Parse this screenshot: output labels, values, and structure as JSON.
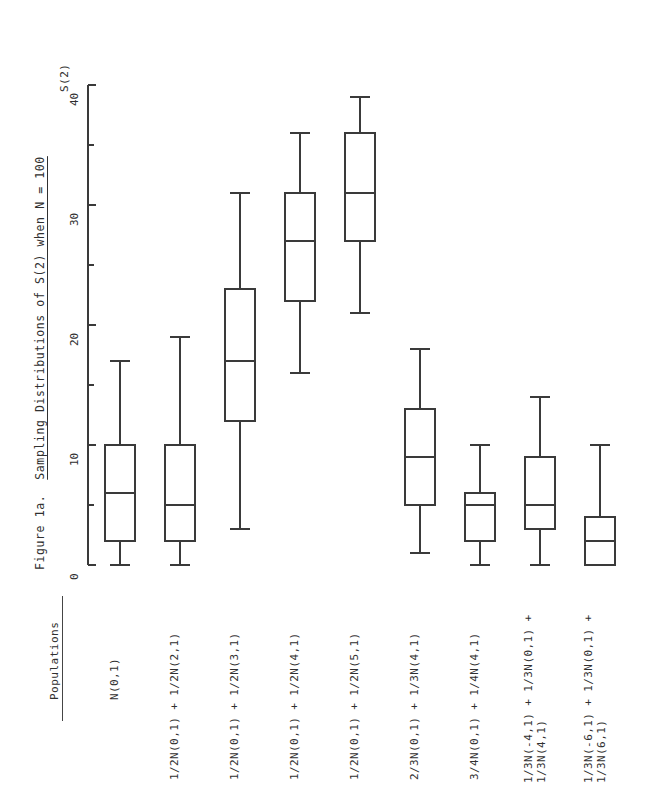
{
  "figure": {
    "caption_prefix": "Figure 1a.",
    "caption_title": "Sampling Distributions of S(2) when N = 100",
    "axis_title": "S(2)",
    "populations_header": "Populations"
  },
  "chart_data": {
    "type": "box",
    "xlabel": "Populations",
    "ylabel": "S(2)",
    "ylim": [
      0,
      42
    ],
    "yticks": [
      0,
      5,
      10,
      15,
      20,
      25,
      30,
      35,
      40
    ],
    "ytick_labels": [
      "0",
      "",
      "10",
      "",
      "20",
      "",
      "30",
      "",
      "40"
    ],
    "grid": false,
    "legend": "none",
    "orientation": "vertical",
    "categories": [
      "N(0,1)",
      "1/2N(0,1) + 1/2N(2,1)",
      "1/2N(0,1) + 1/2N(3,1)",
      "1/2N(0,1) + 1/2N(4,1)",
      "1/2N(0,1) + 1/2N(5,1)",
      "2/3N(0,1) + 1/3N(4,1)",
      "3/4N(0,1) + 1/4N(4,1)",
      "1/3N(-4,1) + 1/3N(0,1) +\n1/3N(4,1)",
      "1/3N(-6,1) + 1/3N(0,1) +\n1/3N(6,1)"
    ],
    "boxes": [
      {
        "label": "N(0,1)",
        "min": 0,
        "q1": 2,
        "median": 6,
        "q3": 10,
        "max": 17
      },
      {
        "label": "1/2N(0,1) + 1/2N(2,1)",
        "min": 0,
        "q1": 2,
        "median": 5,
        "q3": 10,
        "max": 19
      },
      {
        "label": "1/2N(0,1) + 1/2N(3,1)",
        "min": 3,
        "q1": 12,
        "median": 17,
        "q3": 23,
        "max": 31
      },
      {
        "label": "1/2N(0,1) + 1/2N(4,1)",
        "min": 16,
        "q1": 22,
        "median": 27,
        "q3": 31,
        "max": 36
      },
      {
        "label": "1/2N(0,1) + 1/2N(5,1)",
        "min": 21,
        "q1": 27,
        "median": 31,
        "q3": 36,
        "max": 39
      },
      {
        "label": "2/3N(0,1) + 1/3N(4,1)",
        "min": 1,
        "q1": 5,
        "median": 9,
        "q3": 13,
        "max": 18
      },
      {
        "label": "3/4N(0,1) + 1/4N(4,1)",
        "min": 0,
        "q1": 2,
        "median": 5,
        "q3": 6,
        "max": 10
      },
      {
        "label": "1/3N(-4,1) + 1/3N(0,1) + 1/3N(4,1)",
        "min": 0,
        "q1": 3,
        "median": 5,
        "q3": 9,
        "max": 14
      },
      {
        "label": "1/3N(-6,1) + 1/3N(0,1) + 1/3N(6,1)",
        "min": 0,
        "q1": 0,
        "median": 2,
        "q3": 4,
        "max": 10
      }
    ]
  },
  "labels": {
    "pop1": "N(0,1)",
    "pop2": "1/2N(0,1) + 1/2N(2,1)",
    "pop3": "1/2N(0,1) + 1/2N(3,1)",
    "pop4": "1/2N(0,1) + 1/2N(4,1)",
    "pop5": "1/2N(0,1) + 1/2N(5,1)",
    "pop6": "2/3N(0,1) + 1/3N(4,1)",
    "pop7": "3/4N(0,1) + 1/4N(4,1)",
    "pop8": "1/3N(-4,1) + 1/3N(0,1) +\n1/3N(4,1)",
    "pop9": "1/3N(-6,1) + 1/3N(0,1) +\n1/3N(6,1)"
  },
  "ticks": {
    "t0": "0",
    "t10": "10",
    "t20": "20",
    "t30": "30",
    "t40": "40"
  },
  "colors": {
    "ink": "#2e2e2e",
    "line": "#3a3a3a",
    "background": "#ffffff"
  }
}
